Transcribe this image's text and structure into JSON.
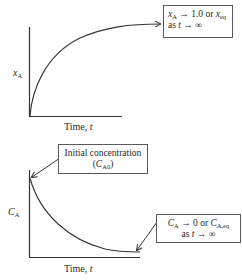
{
  "top_plot": {
    "y_axis_label": "x",
    "y_axis_label_sub": "A",
    "x_axis_label_prefix": "Time, ",
    "x_axis_label_var": "t",
    "annotation": {
      "line1_var": "x",
      "line1_sub": "A",
      "line1_mid": " → 1.0 or ",
      "line1_var2": "x",
      "line1_sub2": "eq",
      "line2_prefix": "as ",
      "line2_var": "t",
      "line2_suffix": " → ∞"
    },
    "curve": "increasing, saturating"
  },
  "bottom_plot": {
    "y_axis_label": "C",
    "y_axis_label_sub": "A",
    "x_axis_label_prefix": "Time, ",
    "x_axis_label_var": "t",
    "annotation_initial": {
      "line1": "Initial concentration",
      "line2_open": "(",
      "line2_var": "C",
      "line2_sub": "A0",
      "line2_close": ")"
    },
    "annotation_final": {
      "line1_var": "C",
      "line1_sub": "A",
      "line1_mid": " → 0 or ",
      "line1_var2": "C",
      "line1_sub2": "A,eq",
      "line2_prefix": "as ",
      "line2_var": "t",
      "line2_suffix": " → ∞"
    },
    "curve": "decreasing, decaying"
  },
  "colors": {
    "line": "#333333",
    "box_border": "#5a5a5a",
    "background": "#ffffff"
  }
}
